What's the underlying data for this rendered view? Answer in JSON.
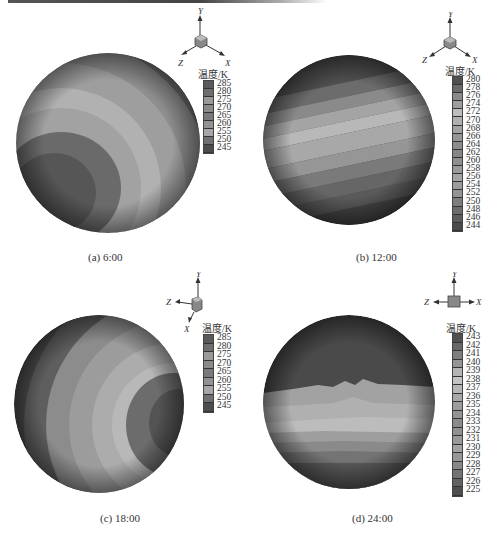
{
  "figure": {
    "legend_title": "温度/K",
    "axes": {
      "x": "X",
      "y": "Y",
      "z": "Z"
    },
    "panels": [
      {
        "id": "a",
        "caption": "(a) 6:00",
        "legend_labels": [
          "285",
          "280",
          "275",
          "270",
          "265",
          "260",
          "255",
          "250",
          "245"
        ],
        "legend_colors": [
          "#5a5a5a",
          "#6e6e6e",
          "#9a9a9a",
          "#8a8a8a",
          "#7a7a7a",
          "#929292",
          "#a6a6a6",
          "#707070",
          "#4c4c4c"
        ]
      },
      {
        "id": "b",
        "caption": "(b) 12:00",
        "legend_labels": [
          "280",
          "278",
          "276",
          "274",
          "272",
          "270",
          "268",
          "266",
          "264",
          "262",
          "260",
          "258",
          "256",
          "254",
          "252",
          "250",
          "248",
          "246",
          "244"
        ],
        "legend_colors": [
          "#505050",
          "#6a6a6a",
          "#8a8a8a",
          "#9e9e9e",
          "#bdbdbd",
          "#b0b0b0",
          "#a2a2a2",
          "#959595",
          "#8c8c8c",
          "#868686",
          "#8f8f8f",
          "#9a9a9a",
          "#a4a4a4",
          "#9c9c9c",
          "#939393",
          "#7d7d7d",
          "#6c6c6c",
          "#5c5c5c",
          "#4a4a4a"
        ]
      },
      {
        "id": "c",
        "caption": "(c) 18:00",
        "legend_labels": [
          "285",
          "280",
          "275",
          "270",
          "265",
          "260",
          "255",
          "250",
          "245"
        ],
        "legend_colors": [
          "#5a5a5a",
          "#6e6e6e",
          "#9a9a9a",
          "#8a8a8a",
          "#7a7a7a",
          "#929292",
          "#a6a6a6",
          "#707070",
          "#4c4c4c"
        ]
      },
      {
        "id": "d",
        "caption": "(d) 24:00",
        "legend_labels": [
          "243",
          "242",
          "241",
          "240",
          "239",
          "238",
          "237",
          "236",
          "235",
          "234",
          "233",
          "232",
          "231",
          "230",
          "229",
          "228",
          "227",
          "226",
          "225"
        ],
        "legend_colors": [
          "#505050",
          "#686868",
          "#7e7e7e",
          "#959595",
          "#b4b4b4",
          "#c2c2c2",
          "#b6b6b6",
          "#a8a8a8",
          "#9c9c9c",
          "#939393",
          "#8b8b8b",
          "#909090",
          "#999999",
          "#a2a2a2",
          "#979797",
          "#888888",
          "#747474",
          "#626262",
          "#4e4e4e"
        ]
      }
    ]
  }
}
